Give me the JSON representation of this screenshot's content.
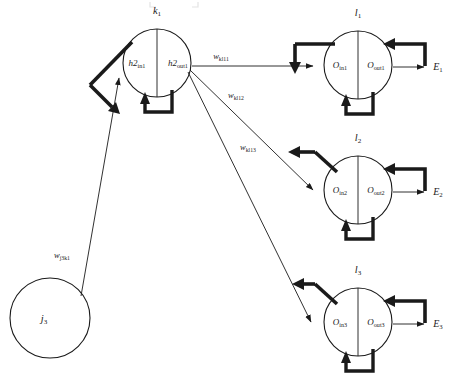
{
  "diagram": {
    "type": "neural-network-backpropagation",
    "title_artifact": "",
    "nodes": {
      "input": {
        "id": "j3-node",
        "label": "j",
        "label_sub": "3",
        "cx": 50,
        "cy": 318,
        "r": 40,
        "style": "plain-circle"
      },
      "hidden": {
        "id": "k1-node",
        "top_label": "k",
        "top_label_sub": "1",
        "in_label": "h2",
        "in_label_sub": "in1",
        "out_label": "h2",
        "out_label_sub": "out1",
        "cx": 157,
        "cy": 63,
        "r": 34,
        "style": "split-circle-with-loop"
      },
      "outputs": [
        {
          "id": "l1-node",
          "top_label": "l",
          "top_label_sub": "1",
          "in_label": "O",
          "in_label_sub": "in1",
          "out_label": "O",
          "out_label_sub": "out1",
          "error_label": "E",
          "error_label_sub": "1",
          "cx": 358,
          "cy": 65,
          "r": 34
        },
        {
          "id": "l2-node",
          "top_label": "l",
          "top_label_sub": "2",
          "in_label": "O",
          "in_label_sub": "in2",
          "out_label": "O",
          "out_label_sub": "out2",
          "error_label": "E",
          "error_label_sub": "2",
          "cx": 358,
          "cy": 190,
          "r": 34
        },
        {
          "id": "l3-node",
          "top_label": "l",
          "top_label_sub": "3",
          "in_label": "O",
          "in_label_sub": "in3",
          "out_label": "O",
          "out_label_sub": "out3",
          "error_label": "E",
          "error_label_sub": "3",
          "cx": 358,
          "cy": 322,
          "r": 34
        }
      ]
    },
    "edges": [
      {
        "id": "w-j3k1",
        "label": "w",
        "label_sub": "j3k1",
        "from": "j3-node",
        "to": "k1-node",
        "lx": 62,
        "ly": 258
      },
      {
        "id": "w-kl11",
        "label": "w",
        "label_sub": "kl11",
        "from": "k1-node",
        "to": "l1-node",
        "lx": 221,
        "ly": 59
      },
      {
        "id": "w-kl12",
        "label": "w",
        "label_sub": "kl12",
        "from": "k1-node",
        "to": "l2-node",
        "lx": 231,
        "ly": 96
      },
      {
        "id": "w-kl13",
        "label": "w",
        "label_sub": "kl13",
        "from": "k1-node",
        "to": "l3-node",
        "lx": 242,
        "ly": 148
      }
    ],
    "colors": {
      "stroke": "#1a1a1a",
      "thick_stroke": "#1a1a1a",
      "background": "#ffffff"
    }
  }
}
